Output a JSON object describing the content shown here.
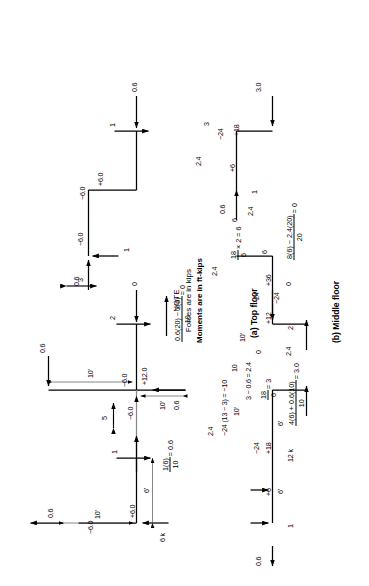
{
  "figure": {
    "note": {
      "title": "NOTE",
      "line1": "Forces are in kips",
      "line2": "Moments are in ft-kips"
    },
    "captions": {
      "top": "(a) Top floor",
      "middle": "(b) Middle floor"
    }
  },
  "top_floor": {
    "bay1": {
      "moment_left_top": "−6.0",
      "moment_left_bottom": "+6.0",
      "dim_height": "10'",
      "dim_span": "6'",
      "shear_top": "0.6",
      "load_base": "6 k",
      "force_down": "1",
      "reaction_eq_num": "1(6)",
      "reaction_eq_den": "10",
      "reaction_eq_result": "= 0.6"
    },
    "joint1": {
      "axial": "5"
    },
    "bay2": {
      "moment_upper_left": "−6.0",
      "moment_upper_right": "−6.0",
      "moment_lower": "+12.0",
      "shear_left": "0.6",
      "shear_top": "0.6",
      "dim_height_left": "10'",
      "dim_height_right": "10'",
      "force_down": "2",
      "force_right": "0",
      "reaction_eq_num": "0.6(20) − 2(6)",
      "reaction_eq_den": "10",
      "reaction_eq_result": "= 0"
    },
    "joint2": {
      "axial": "3"
    },
    "bay3": {
      "moment_left": "−6.0",
      "moment_right_top": "−6.0",
      "moment_right_bottom": "+6.0",
      "shear_left": "0.6",
      "shear_right": "0.6",
      "axial_up": "1",
      "force_down": "1",
      "force_left": "0.6"
    }
  },
  "middle_floor": {
    "bay1": {
      "moment_left": "+6",
      "moment_center_top": "−24",
      "moment_center_bottom": "+18",
      "shear_left": "0.6",
      "axial_up": "1",
      "load_center": "12 k",
      "dim_span_left": "6'",
      "dim_span_right": "6'",
      "dim_height": "10'",
      "calc_top": "−24 (13 − 3) = −10",
      "calc_mid": "3 − 0.6 = 2.4",
      "calc_frac_num": "18",
      "calc_frac_den": "6",
      "calc_frac_result": "= 3",
      "reaction_eq_num": "4(6) + 0.6(10)",
      "reaction_eq_den": "10",
      "reaction_eq_result": "= 3.0",
      "shear_top": "2.4"
    },
    "joint1": {
      "axial": "10"
    },
    "bay2": {
      "moment_upper_left": "+12",
      "moment_upper_right": "−24",
      "moment_lower_left": "−24",
      "moment_lower_right": "+36",
      "shear_left": "0",
      "axial_up": "2",
      "shear_bottom": "2.4",
      "dim_height": "10'",
      "shear_top": "2.4",
      "force_down": "6",
      "force_right": "0",
      "calc_frac_num": "18",
      "calc_frac_den": "6",
      "calc_mult": "× 2 = 6",
      "reaction_eq_num": "8(6) − 2.4(20)",
      "reaction_eq_den": "20",
      "reaction_eq_result": "= 0"
    },
    "joint2": {
      "axial": "6"
    },
    "bay3": {
      "moment_left": "+6",
      "moment_right_top": "−24",
      "moment_right_bottom": "+18",
      "shear_left": "0.6",
      "axial_up": "1",
      "shear_bottom": "2.4",
      "shear_top": "2.4",
      "force_down": "3",
      "force_left": "3.0"
    }
  }
}
